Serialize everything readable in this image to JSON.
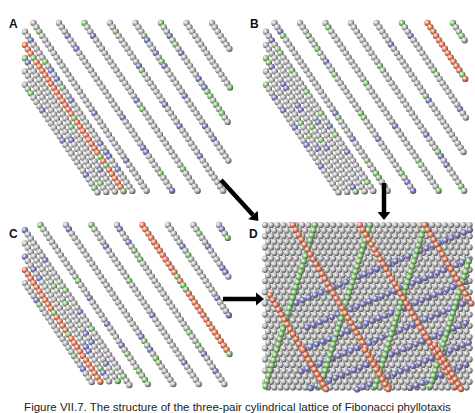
{
  "figure": {
    "panels": [
      {
        "id": "A",
        "label": "A"
      },
      {
        "id": "B",
        "label": "B"
      },
      {
        "id": "C",
        "label": "C"
      },
      {
        "id": "D",
        "label": "D"
      }
    ],
    "caption": "Figure VII.7. The structure of the three-pair cylindrical lattice of Fibonacci phyllotaxis",
    "colors": {
      "gray_ball": "#b4b4b4",
      "blue_ball": "#7676c8",
      "green_ball": "#7cc468",
      "orange_ball": "#f0764e",
      "arrow": "#000000"
    },
    "arrows": [
      {
        "from": "A",
        "to": "D",
        "direction": "diagonal-down-right"
      },
      {
        "from": "B",
        "to": "D",
        "direction": "down"
      },
      {
        "from": "C",
        "to": "D",
        "direction": "right"
      }
    ]
  }
}
